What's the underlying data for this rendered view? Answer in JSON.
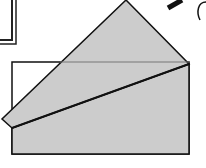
{
  "diagram": {
    "type": "origami-fold-step",
    "colors": {
      "paper_fill": "#cccccc",
      "stroke": "#111111",
      "background": "#ffffff",
      "back_rect_fill": "#ffffff"
    }
  }
}
